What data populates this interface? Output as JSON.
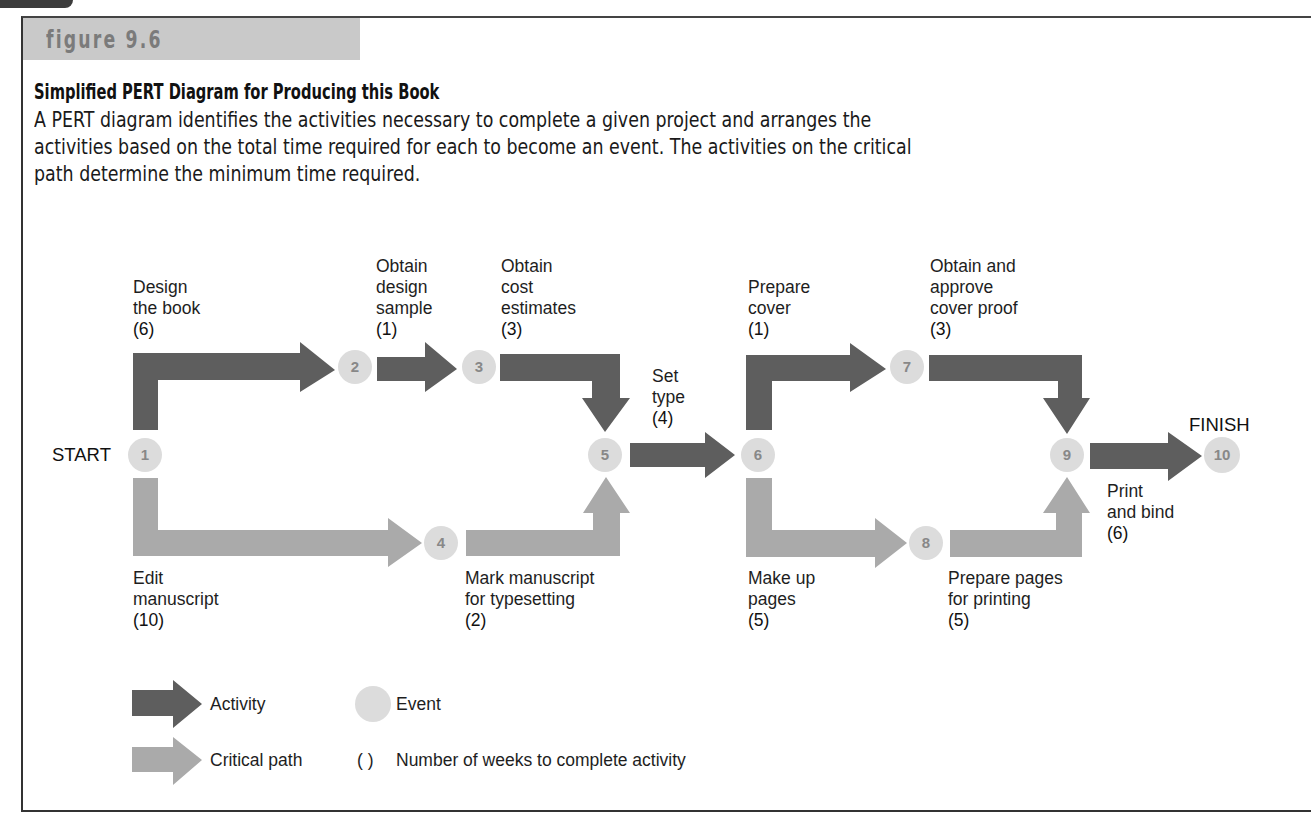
{
  "figure": {
    "label": "figure 9.6",
    "title": "Simplified PERT Diagram for Producing this Book",
    "caption_lines": [
      "A PERT diagram identifies the activities necessary to complete a given project and arranges the",
      "activities based on the total time required for each to become an event. The activities on the critical",
      "path determine the minimum time required."
    ]
  },
  "colors": {
    "activity": "#5e5e5e",
    "critical_path": "#aaaaaa",
    "event": "#dcdcdc",
    "event_text": "#888888",
    "header_band": "#c9c9c9"
  },
  "diagram": {
    "start_label": "START",
    "finish_label": "FINISH",
    "events": [
      "1",
      "2",
      "3",
      "4",
      "5",
      "6",
      "7",
      "8",
      "9",
      "10"
    ],
    "activities": [
      {
        "from": "1",
        "to": "2",
        "lines": [
          "Design",
          "the book"
        ],
        "weeks": "(6)",
        "critical": false
      },
      {
        "from": "2",
        "to": "3",
        "lines": [
          "Obtain",
          "design",
          "sample"
        ],
        "weeks": "(1)",
        "critical": false
      },
      {
        "from": "3",
        "to": "5",
        "lines": [
          "Obtain",
          "cost",
          "estimates"
        ],
        "weeks": "(3)",
        "critical": false
      },
      {
        "from": "1",
        "to": "4",
        "lines": [
          "Edit",
          "manuscript"
        ],
        "weeks": "(10)",
        "critical": true
      },
      {
        "from": "4",
        "to": "5",
        "lines": [
          "Mark manuscript",
          "for typesetting"
        ],
        "weeks": "(2)",
        "critical": true
      },
      {
        "from": "5",
        "to": "6",
        "lines": [
          "Set",
          "type"
        ],
        "weeks": "(4)",
        "critical": false
      },
      {
        "from": "6",
        "to": "7",
        "lines": [
          "Prepare",
          "cover"
        ],
        "weeks": "(1)",
        "critical": false
      },
      {
        "from": "7",
        "to": "9",
        "lines": [
          "Obtain and",
          "approve",
          "cover proof"
        ],
        "weeks": "(3)",
        "critical": false
      },
      {
        "from": "6",
        "to": "8",
        "lines": [
          "Make up",
          "pages"
        ],
        "weeks": "(5)",
        "critical": true
      },
      {
        "from": "8",
        "to": "9",
        "lines": [
          "Prepare pages",
          "for printing"
        ],
        "weeks": "(5)",
        "critical": true
      },
      {
        "from": "9",
        "to": "10",
        "lines": [
          "Print",
          "and bind"
        ],
        "weeks": "(6)",
        "critical": false
      }
    ]
  },
  "legend": {
    "activity": "Activity",
    "event": "Event",
    "critical_path": "Critical path",
    "parens_symbol": "( )",
    "parens_meaning": "Number of weeks to complete activity"
  }
}
